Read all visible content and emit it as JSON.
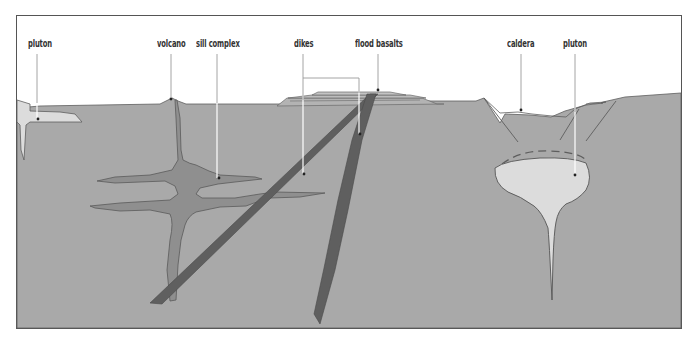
{
  "diagram": {
    "colors": {
      "background": "#ffffff",
      "frame": "#555555",
      "crust": "#a9a9a9",
      "crust_outline": "#5e5e5e",
      "sill_complex": "#8f8f8f",
      "dikes": "#5f5f5f",
      "pluton": "#dcdcdc",
      "flood_basalt_layer": "#b4b4b4",
      "leader_line": "#ffffff"
    },
    "labels": {
      "pluton_left": "pluton",
      "volcano": "volcano",
      "sill_complex": "sill complex",
      "dikes": "dikes",
      "flood_basalts": "flood basalts",
      "caldera": "caldera",
      "pluton_right": "pluton"
    }
  }
}
